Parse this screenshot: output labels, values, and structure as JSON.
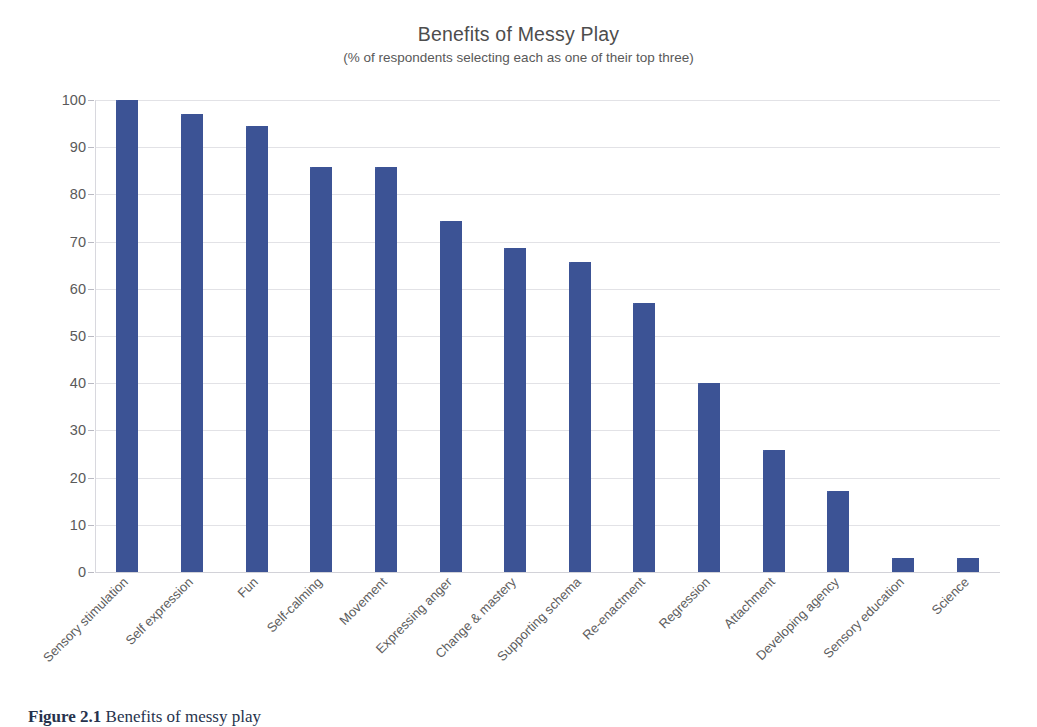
{
  "chart_data": {
    "type": "bar",
    "title": "Benefits of Messy Play",
    "subtitle": "(% of respondents selecting each as one of their top three)",
    "xlabel": "",
    "ylabel": "",
    "ylim": [
      0,
      100
    ],
    "ytick_step": 10,
    "yticks": [
      "100",
      "90",
      "80",
      "70",
      "60",
      "50",
      "40",
      "30",
      "20",
      "10",
      "0"
    ],
    "grid": true,
    "legend": false,
    "bar_color": "#3e569b",
    "categories": [
      "Sensory stimulation",
      "Self expression",
      "Fun",
      "Self-calming",
      "Movement",
      "Expressing anger",
      "Change & mastery",
      "Supporting schema",
      "Re-enactment",
      "Regression",
      "Attachment",
      "Developing agency",
      "Sensory education",
      "Science"
    ],
    "values": [
      100,
      97,
      94.4,
      85.8,
      85.8,
      74.4,
      68.6,
      65.7,
      57.1,
      40,
      25.8,
      17.1,
      2.9,
      2.9
    ]
  },
  "caption": {
    "number": "Figure 2.1",
    "text": "Benefits of messy play"
  }
}
